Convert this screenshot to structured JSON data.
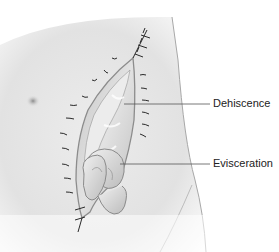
{
  "figure": {
    "labels": [
      {
        "id": "dehiscence",
        "text": "Dehiscence"
      },
      {
        "id": "evisceration",
        "text": "Evisceration"
      }
    ],
    "colors": {
      "skin": "#e6e6e6",
      "skin_shadow": "#c8c8c8",
      "wound_edge": "#9a9a9a",
      "tissue": "#d4d4d4",
      "bowel": "#dcdcdc",
      "suture": "#2a2a2a",
      "leader": "#555555"
    }
  }
}
